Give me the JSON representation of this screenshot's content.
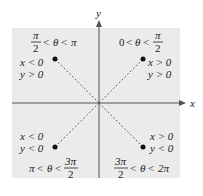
{
  "axes": {
    "x_label": "x",
    "y_label": "y"
  },
  "colors": {
    "panel": "#ebebeb",
    "axis": "#555555",
    "text": "#222222",
    "point": "#111111"
  },
  "quadrants": [
    {
      "id": "I",
      "angle_range": {
        "lower": "0",
        "upper_num": "π",
        "upper_den": "2"
      },
      "conditions": [
        "x > 0",
        "y > 0"
      ]
    },
    {
      "id": "II",
      "angle_range": {
        "lower_num": "π",
        "lower_den": "2",
        "upper": "π"
      },
      "conditions": [
        "x < 0",
        "y > 0"
      ]
    },
    {
      "id": "III",
      "angle_range": {
        "lower": "π",
        "upper_num": "3π",
        "upper_den": "2"
      },
      "conditions": [
        "x < 0",
        "y < 0"
      ]
    },
    {
      "id": "IV",
      "angle_range": {
        "lower_num": "3π",
        "lower_den": "2",
        "upper": "2π"
      },
      "conditions": [
        "x > 0",
        "y < 0"
      ]
    }
  ],
  "theta": "θ",
  "lt": "<"
}
